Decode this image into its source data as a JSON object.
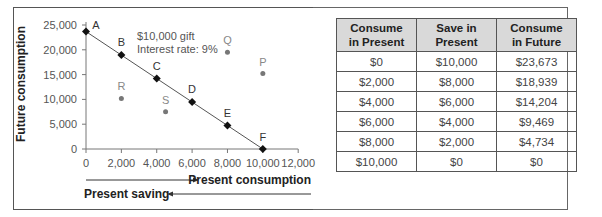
{
  "chart_data": {
    "type": "scatter",
    "title": "",
    "annotation": [
      "$10,000 gift",
      "Interest rate: 9%"
    ],
    "xlabel": "Present consumption",
    "xlabel_reverse": "Present saving",
    "ylabel": "Future consumption",
    "xlim": [
      0,
      12000
    ],
    "ylim": [
      0,
      25000
    ],
    "x_ticks": [
      "0",
      "2,000",
      "4,000",
      "6,000",
      "8,000",
      "10,000",
      "12,000"
    ],
    "y_ticks": [
      "0",
      "5,000",
      "10,000",
      "15,000",
      "20,000",
      "25,000"
    ],
    "grid": false,
    "series": [
      {
        "name": "Budget line",
        "style": "line-diamond",
        "points": [
          {
            "label": "A",
            "x": 0,
            "y": 23673
          },
          {
            "label": "B",
            "x": 2000,
            "y": 18939
          },
          {
            "label": "C",
            "x": 4000,
            "y": 14204
          },
          {
            "label": "D",
            "x": 6000,
            "y": 9469
          },
          {
            "label": "E",
            "x": 8000,
            "y": 4734
          },
          {
            "label": "F",
            "x": 10000,
            "y": 0
          }
        ]
      },
      {
        "name": "Other points",
        "style": "dot-gray",
        "points": [
          {
            "label": "Q",
            "x": 8000,
            "y": 19500
          },
          {
            "label": "P",
            "x": 10000,
            "y": 15200
          },
          {
            "label": "R",
            "x": 2000,
            "y": 10200
          },
          {
            "label": "S",
            "x": 4500,
            "y": 7500
          }
        ]
      }
    ]
  },
  "table": {
    "headers": [
      [
        "Consume",
        "in Present"
      ],
      [
        "Save in",
        "Present"
      ],
      [
        "Consume",
        "in Future"
      ]
    ],
    "rows": [
      [
        "$0",
        "$10,000",
        "$23,673"
      ],
      [
        "$2,000",
        "$8,000",
        "$18,939"
      ],
      [
        "$4,000",
        "$6,000",
        "$14,204"
      ],
      [
        "$6,000",
        "$4,000",
        "$9,469"
      ],
      [
        "$8,000",
        "$2,000",
        "$4,734"
      ],
      [
        "$10,000",
        "$0",
        "$0"
      ]
    ]
  }
}
